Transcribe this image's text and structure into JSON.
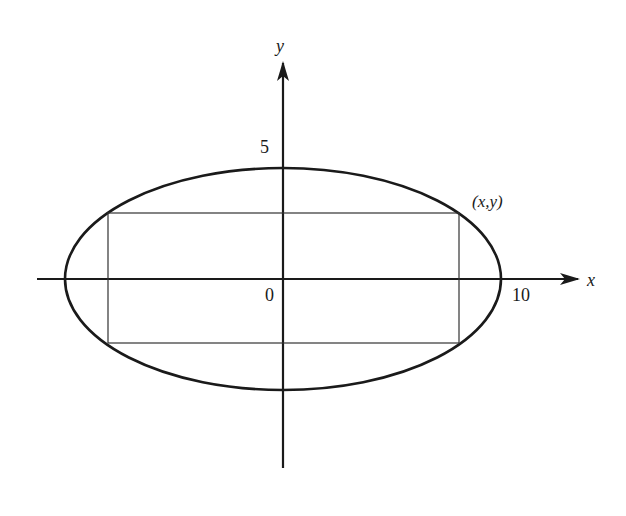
{
  "diagram": {
    "type": "ellipse with inscribed rectangle",
    "axes": {
      "x_label": "x",
      "y_label": "y",
      "origin_label": "0",
      "x_tick_label": "10",
      "y_tick_label": "5"
    },
    "point_label": "(x,y)",
    "ellipse": {
      "semi_major": 10,
      "semi_minor": 5
    },
    "colors": {
      "stroke": "#1a1a1a",
      "background": "#ffffff"
    }
  }
}
